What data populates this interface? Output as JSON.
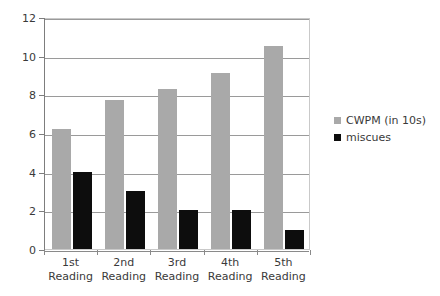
{
  "chart_data": {
    "type": "bar",
    "title": "",
    "subtitle": "",
    "xlabel": "",
    "ylabel": "",
    "ylim": [
      0,
      12
    ],
    "ytick_step": 2,
    "yticks": [
      "0",
      "2",
      "4",
      "6",
      "8",
      "10",
      "12"
    ],
    "grid": true,
    "legend_position": "right",
    "categories": [
      "1st\nReading",
      "2nd\nReading",
      "3rd\nReading",
      "4th\nReading",
      "5th\nReading"
    ],
    "category_lines": [
      [
        "1st",
        "Reading"
      ],
      [
        "2nd",
        "Reading"
      ],
      [
        "3rd",
        "Reading"
      ],
      [
        "4th",
        "Reading"
      ],
      [
        "5th",
        "Reading"
      ]
    ],
    "series": [
      {
        "name": "CWPM (in 10s)",
        "color": "#a9a9a9",
        "values": [
          6.2,
          7.7,
          8.3,
          9.1,
          10.5
        ]
      },
      {
        "name": "miscues",
        "color": "#0d0d0d",
        "values": [
          4,
          3,
          2,
          2,
          1
        ]
      }
    ]
  },
  "legend": {
    "items": [
      {
        "label": "CWPM (in 10s)",
        "swatch_class": "sw-cwpm"
      },
      {
        "label": "miscues",
        "swatch_class": "sw-miscues"
      }
    ]
  }
}
